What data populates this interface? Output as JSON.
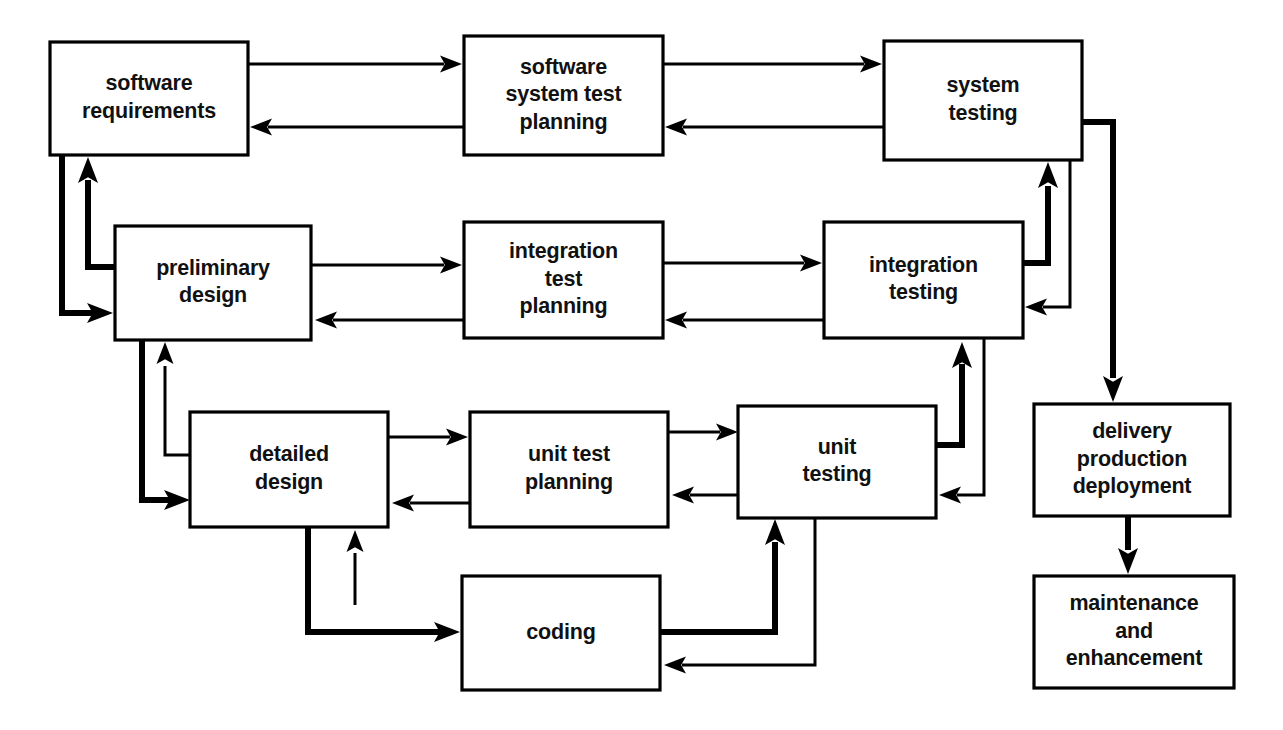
{
  "diagram": {
    "style": {
      "background": "#ffffff",
      "line_color": "#000000",
      "box_fill": "#ffffff",
      "box_stroke": "#000000"
    },
    "nodes": [
      {
        "id": "software-requirements",
        "lines": [
          "software",
          "requirements"
        ],
        "x": 50,
        "y": 42,
        "w": 198,
        "h": 113
      },
      {
        "id": "software-system-test-planning",
        "lines": [
          "software",
          "system test",
          "planning"
        ],
        "x": 464,
        "y": 36,
        "w": 199,
        "h": 119
      },
      {
        "id": "system-testing",
        "lines": [
          "system",
          "testing"
        ],
        "x": 884,
        "y": 41,
        "w": 198,
        "h": 119
      },
      {
        "id": "preliminary-design",
        "lines": [
          "preliminary",
          "design"
        ],
        "x": 115,
        "y": 226,
        "w": 196,
        "h": 114
      },
      {
        "id": "integration-test-planning",
        "lines": [
          "integration",
          "test",
          "planning"
        ],
        "x": 464,
        "y": 222,
        "w": 199,
        "h": 116
      },
      {
        "id": "integration-testing",
        "lines": [
          "integration",
          "testing"
        ],
        "x": 824,
        "y": 222,
        "w": 199,
        "h": 116
      },
      {
        "id": "detailed-design",
        "lines": [
          "detailed",
          "design"
        ],
        "x": 190,
        "y": 412,
        "w": 198,
        "h": 115
      },
      {
        "id": "unit-test-planning",
        "lines": [
          "unit test",
          "planning"
        ],
        "x": 470,
        "y": 412,
        "w": 198,
        "h": 115
      },
      {
        "id": "unit-testing",
        "lines": [
          "unit",
          "testing"
        ],
        "x": 738,
        "y": 406,
        "w": 198,
        "h": 112
      },
      {
        "id": "coding",
        "lines": [
          "coding"
        ],
        "x": 462,
        "y": 576,
        "w": 198,
        "h": 114
      },
      {
        "id": "delivery-production-deployment",
        "lines": [
          "delivery",
          "production",
          "deployment"
        ],
        "x": 1034,
        "y": 404,
        "w": 196,
        "h": 112
      },
      {
        "id": "maintenance-and-enhancement",
        "lines": [
          "maintenance",
          "and",
          "enhancement"
        ],
        "x": 1034,
        "y": 576,
        "w": 200,
        "h": 112
      }
    ],
    "edges": [
      {
        "id": "req-to-sys-test-planning",
        "from": "software-requirements",
        "to": "software-system-test-planning",
        "weight": "thin",
        "path": "M 248 64 L 444 64",
        "head": {
          "x": 462,
          "y": 64,
          "dir": "right"
        }
      },
      {
        "id": "sys-test-planning-to-req",
        "from": "software-system-test-planning",
        "to": "software-requirements",
        "weight": "thin",
        "path": "M 464 127 L 268 127",
        "head": {
          "x": 250,
          "y": 127,
          "dir": "left"
        }
      },
      {
        "id": "sys-test-planning-to-system-testing",
        "from": "software-system-test-planning",
        "to": "system-testing",
        "weight": "thin",
        "path": "M 663 64 L 864 64",
        "head": {
          "x": 882,
          "y": 64,
          "dir": "right"
        }
      },
      {
        "id": "system-testing-to-sys-test-planning",
        "from": "system-testing",
        "to": "software-system-test-planning",
        "weight": "thin",
        "path": "M 884 127 L 683 127",
        "head": {
          "x": 665,
          "y": 127,
          "dir": "left"
        }
      },
      {
        "id": "req-to-preliminary-design",
        "from": "software-requirements",
        "to": "preliminary-design",
        "weight": "thick",
        "path": "M 62 155 L 62 313 L 95 313",
        "head": {
          "x": 113,
          "y": 313,
          "dir": "right"
        }
      },
      {
        "id": "preliminary-design-to-req",
        "from": "preliminary-design",
        "to": "software-requirements",
        "weight": "thick",
        "path": "M 115 267 L 88 267 L 88 180",
        "head": {
          "x": 88,
          "y": 157,
          "dir": "up"
        }
      },
      {
        "id": "preliminary-design-to-int-test-planning",
        "from": "preliminary-design",
        "to": "integration-test-planning",
        "weight": "thin",
        "path": "M 311 265 L 444 265",
        "head": {
          "x": 462,
          "y": 265,
          "dir": "right"
        }
      },
      {
        "id": "int-test-planning-to-preliminary-design",
        "from": "integration-test-planning",
        "to": "preliminary-design",
        "weight": "thin",
        "path": "M 464 320 L 333 320",
        "head": {
          "x": 315,
          "y": 320,
          "dir": "left"
        }
      },
      {
        "id": "int-test-planning-to-int-testing",
        "from": "integration-test-planning",
        "to": "integration-testing",
        "weight": "thin",
        "path": "M 663 263 L 804 263",
        "head": {
          "x": 822,
          "y": 263,
          "dir": "right"
        }
      },
      {
        "id": "int-testing-to-int-test-planning",
        "from": "integration-testing",
        "to": "integration-test-planning",
        "weight": "thin",
        "path": "M 824 320 L 683 320",
        "head": {
          "x": 665,
          "y": 320,
          "dir": "left"
        }
      },
      {
        "id": "int-testing-to-system-testing",
        "from": "integration-testing",
        "to": "system-testing",
        "weight": "thick",
        "path": "M 1023 263 L 1048 263 L 1048 186",
        "head": {
          "x": 1048,
          "y": 162,
          "dir": "up"
        }
      },
      {
        "id": "system-testing-to-int-testing",
        "from": "system-testing",
        "to": "integration-testing",
        "weight": "thin",
        "path": "M 1070 160 L 1070 307 L 1043 307",
        "head": {
          "x": 1025,
          "y": 307,
          "dir": "left"
        }
      },
      {
        "id": "preliminary-design-to-detailed-design",
        "from": "preliminary-design",
        "to": "detailed-design",
        "weight": "thick",
        "path": "M 142 340 L 142 500 L 172 500",
        "head": {
          "x": 190,
          "y": 500,
          "dir": "right"
        }
      },
      {
        "id": "detailed-design-to-preliminary-design",
        "from": "detailed-design",
        "to": "preliminary-design",
        "weight": "thin",
        "path": "M 190 455 L 165 455 L 165 366",
        "head": {
          "x": 165,
          "y": 342,
          "dir": "up"
        }
      },
      {
        "id": "detailed-design-to-unit-test-planning",
        "from": "detailed-design",
        "to": "unit-test-planning",
        "weight": "thin",
        "path": "M 388 437 L 450 437",
        "head": {
          "x": 468,
          "y": 437,
          "dir": "right"
        }
      },
      {
        "id": "unit-test-planning-to-detailed-design",
        "from": "unit-test-planning",
        "to": "detailed-design",
        "weight": "thin",
        "path": "M 470 503 L 410 503",
        "head": {
          "x": 392,
          "y": 503,
          "dir": "left"
        }
      },
      {
        "id": "unit-test-planning-to-unit-testing",
        "from": "unit-test-planning",
        "to": "unit-testing",
        "weight": "thin",
        "path": "M 668 432 L 720 432",
        "head": {
          "x": 738,
          "y": 432,
          "dir": "right"
        }
      },
      {
        "id": "unit-testing-to-unit-test-planning",
        "from": "unit-testing",
        "to": "unit-test-planning",
        "weight": "thin",
        "path": "M 738 495 L 690 495",
        "head": {
          "x": 672,
          "y": 495,
          "dir": "left"
        }
      },
      {
        "id": "unit-testing-to-int-testing",
        "from": "unit-testing",
        "to": "integration-testing",
        "weight": "thick",
        "path": "M 936 445 L 962 445 L 962 364",
        "head": {
          "x": 962,
          "y": 342,
          "dir": "up"
        }
      },
      {
        "id": "int-testing-to-unit-testing",
        "from": "integration-testing",
        "to": "unit-testing",
        "weight": "thin",
        "path": "M 984 338 L 984 495 L 957 495",
        "head": {
          "x": 939,
          "y": 495,
          "dir": "left"
        }
      },
      {
        "id": "detailed-design-to-coding",
        "from": "detailed-design",
        "to": "coding",
        "weight": "thick",
        "path": "M 308 527 L 308 632 L 442 632",
        "head": {
          "x": 460,
          "y": 632,
          "dir": "right"
        }
      },
      {
        "id": "coding-to-detailed-design",
        "from": "coding",
        "to": "detailed-design",
        "weight": "thin",
        "path": "M 355 605 L 355 553",
        "head": {
          "x": 355,
          "y": 530,
          "dir": "up"
        }
      },
      {
        "id": "coding-to-unit-testing",
        "from": "coding",
        "to": "unit-testing",
        "weight": "thick",
        "path": "M 660 632 L 775 632 L 775 542",
        "head": {
          "x": 775,
          "y": 519,
          "dir": "up"
        }
      },
      {
        "id": "unit-testing-to-coding",
        "from": "unit-testing",
        "to": "coding",
        "weight": "thin",
        "path": "M 815 518 L 815 665 L 682 665",
        "head": {
          "x": 664,
          "y": 665,
          "dir": "left"
        }
      },
      {
        "id": "system-testing-to-delivery",
        "from": "system-testing",
        "to": "delivery-production-deployment",
        "weight": "thick",
        "path": "M 1082 122 L 1113 122 L 1113 378",
        "head": {
          "x": 1113,
          "y": 402,
          "dir": "down"
        }
      },
      {
        "id": "delivery-to-maintenance",
        "from": "delivery-production-deployment",
        "to": "maintenance-and-enhancement",
        "weight": "thick",
        "path": "M 1128 516 L 1128 550",
        "head": {
          "x": 1128,
          "y": 574,
          "dir": "down"
        }
      }
    ]
  }
}
